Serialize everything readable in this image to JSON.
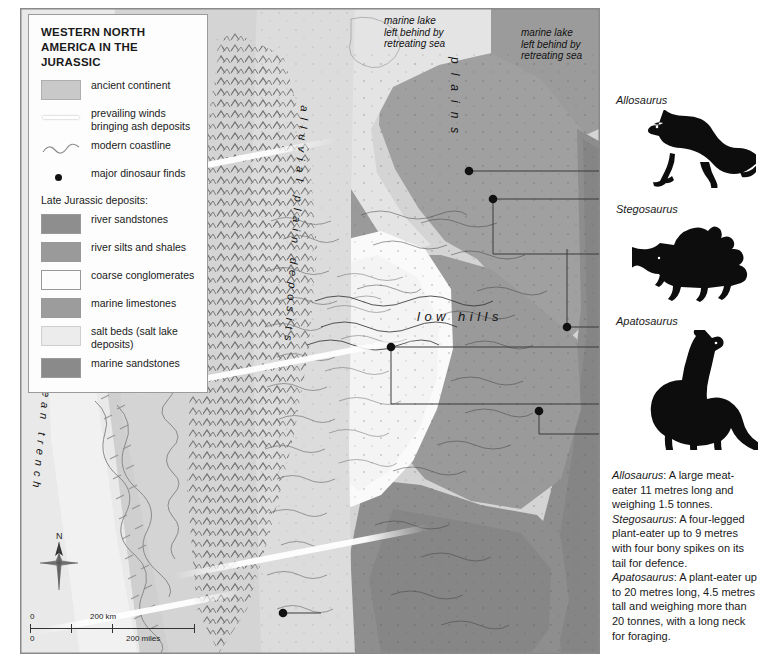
{
  "legend": {
    "title": "WESTERN NORTH AMERICA IN THE JURASSIC",
    "items": [
      {
        "label": "ancient continent",
        "key": "swatch",
        "color": "#c9c9c9"
      },
      {
        "label": "prevailing winds bringing ash deposits",
        "key": "wind-streak",
        "color": "#ffffff"
      },
      {
        "label": "modern coastline",
        "key": "coastline",
        "color": "#8a8a8a"
      },
      {
        "label": "major dinosaur finds",
        "key": "dot",
        "color": "#111111"
      }
    ],
    "subheading": "Late Jurassic deposits:",
    "deposits": [
      {
        "label": "river sandstones",
        "color": "#8e8e8e"
      },
      {
        "label": "river silts and shales",
        "color": "#9a9a9a"
      },
      {
        "label": "coarse conglomerates",
        "color": "#fdfdfd"
      },
      {
        "label": "marine limestones",
        "color": "#9c9c9c"
      },
      {
        "label": "salt beds (salt lake deposits)",
        "color": "#ececec"
      },
      {
        "label": "marine sandstones",
        "color": "#8a8a8a"
      }
    ]
  },
  "map_labels": {
    "marine_lake_left": "marine lake\nleft behind by\nretreating sea",
    "marine_lake_right": "marine lake\nleft behind by\nretreating sea",
    "plains": "plains",
    "low_hills": "low hills",
    "volcanic_mountains": "volcanic mountains",
    "alluvial_plain_deposits": "alluvial plain deposits",
    "ocean_trench": "ocean trench"
  },
  "scale": {
    "km_zero": "0",
    "km_label": "200 km",
    "miles_zero": "0",
    "miles_label": "200 miles"
  },
  "compass": {
    "north": "N"
  },
  "dinosaurs": [
    {
      "name": "Allosaurus",
      "silhouette": "theropod-silhouette"
    },
    {
      "name": "Stegosaurus",
      "silhouette": "stegosaur-silhouette"
    },
    {
      "name": "Apatosaurus",
      "silhouette": "sauropod-silhouette"
    }
  ],
  "descriptions": [
    {
      "name": "Allosaurus",
      "text": ": A large meat-eater 11 metres long and weighing 1.5 tonnes."
    },
    {
      "name": "Stegosaurus",
      "text": ": A four-legged plant-eater up to 9 metres with four bony spikes on its tail for defence."
    },
    {
      "name": "Apatosaurus",
      "text": ": A plant-eater up to 20 metres long, 4.5 metres tall and weighing more than 20 tonnes, with a long neck for foraging."
    }
  ],
  "colors": {
    "ancient_continent": "#c9c9c9",
    "river_sandstones": "#8e8e8e",
    "river_silts_shales": "#9a9a9a",
    "coarse_conglomerates": "#fdfdfd",
    "marine_limestones": "#9c9c9c",
    "salt_beds": "#ececec",
    "marine_sandstones": "#8a8a8a",
    "ocean": "#e6e6e6",
    "find_dot": "#111111",
    "frame": "#8a8a8a"
  }
}
